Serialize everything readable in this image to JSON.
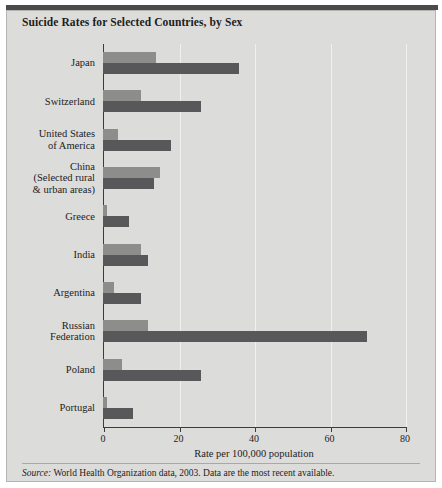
{
  "title": "Suicide Rates for Selected Countries, by Sex",
  "source_label": "Source:",
  "source_text": " World Health Organization data, 2003. Data are the most recent available.",
  "legend": {
    "position": "top-right",
    "items": [
      {
        "label": "Females",
        "color": "#8d8d8b"
      },
      {
        "label": "Males",
        "color": "#58585a"
      }
    ]
  },
  "colors": {
    "panel_background": "#dcdcda",
    "female_bar": "#8d8d8b",
    "male_bar": "#58585a",
    "axis": "#3c3c3c",
    "gridline": "#f0f0ee",
    "top_rule": "#4b4b4b"
  },
  "chart_data": {
    "type": "bar",
    "orientation": "horizontal",
    "title": "Suicide Rates for Selected Countries, by Sex",
    "xlabel": "Rate per 100,000 population",
    "ylabel": "",
    "xlim": [
      0,
      80
    ],
    "xticks": [
      0,
      20,
      40,
      60,
      80
    ],
    "xticklabels": [
      "0",
      "20",
      "40",
      "60",
      "80"
    ],
    "grid": true,
    "legend": [
      "Females",
      "Males"
    ],
    "categories": [
      "Japan",
      "Switzerland",
      "United States\nof America",
      "China\n(Selected rural\n& urban areas)",
      "Greece",
      "India",
      "Argentina",
      "Russian\nFederation",
      "Poland",
      "Portugal"
    ],
    "category_lines": [
      [
        "Japan"
      ],
      [
        "Switzerland"
      ],
      [
        "United States",
        "of America"
      ],
      [
        "China",
        "(Selected rural",
        "& urban areas)"
      ],
      [
        "Greece"
      ],
      [
        "India"
      ],
      [
        "Argentina"
      ],
      [
        "Russian",
        "Federation"
      ],
      [
        "Poland"
      ],
      [
        "Portugal"
      ]
    ],
    "series": [
      {
        "name": "Females",
        "values": [
          14,
          10,
          4,
          15,
          1,
          10,
          3,
          12,
          5,
          1
        ]
      },
      {
        "name": "Males",
        "values": [
          36,
          26,
          18,
          13.5,
          7,
          12,
          10,
          70,
          26,
          8
        ]
      }
    ]
  }
}
